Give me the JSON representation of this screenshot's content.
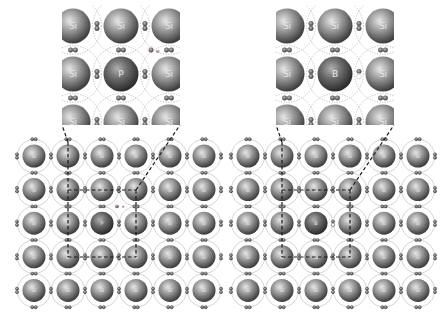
{
  "figure": {
    "panels": [
      {
        "id": "n-type",
        "dopant": "P",
        "host": "Si",
        "carrier_label": "e",
        "carrier": "free electron",
        "grid": {
          "rows": 5,
          "cols": 6,
          "labels": [
            [
              "Si",
              "Si",
              "Si",
              "Si",
              "Si",
              "Si"
            ],
            [
              "Si",
              "Si",
              "Si",
              "Si",
              "Si",
              "Si"
            ],
            [
              "Si",
              "Si",
              "P",
              "Si",
              "Si",
              "Si"
            ],
            [
              "Si",
              "Si",
              "Si",
              "Si",
              "Si",
              "Si"
            ],
            [
              "Si",
              "Si",
              "Si",
              "Si",
              "Si",
              "Si"
            ]
          ]
        },
        "inset": {
          "labels": [
            [
              "Si",
              "Si",
              "Si"
            ],
            [
              "Si",
              "P",
              "Si"
            ],
            [
              "Si",
              "Si",
              "Si"
            ]
          ]
        }
      },
      {
        "id": "p-type",
        "dopant": "B",
        "host": "Si",
        "carrier": "hole",
        "grid": {
          "rows": 5,
          "cols": 6,
          "labels": [
            [
              "Si",
              "Si",
              "Si",
              "Si",
              "Si",
              "Si"
            ],
            [
              "Si",
              "Si",
              "Si",
              "Si",
              "Si",
              "Si"
            ],
            [
              "Si",
              "Si",
              "B",
              "Si",
              "Si",
              "Si"
            ],
            [
              "Si",
              "Si",
              "Si",
              "Si",
              "Si",
              "Si"
            ],
            [
              "Si",
              "Si",
              "Si",
              "Si",
              "Si",
              "Si"
            ]
          ]
        },
        "inset": {
          "labels": [
            [
              "Si",
              "Si",
              "Si"
            ],
            [
              "Si",
              "B",
              "Si"
            ],
            [
              "Si",
              "Si",
              "Si"
            ]
          ]
        }
      }
    ]
  },
  "colors": {
    "atom_light": "#d9d9d9",
    "atom_mid": "#8c8c8c",
    "atom_dark": "#3f3f3f",
    "electron": "#5a5a5a",
    "shell": "#c8c8c8",
    "dashed": "#1a1a1a",
    "label": "#e8e8e8"
  }
}
